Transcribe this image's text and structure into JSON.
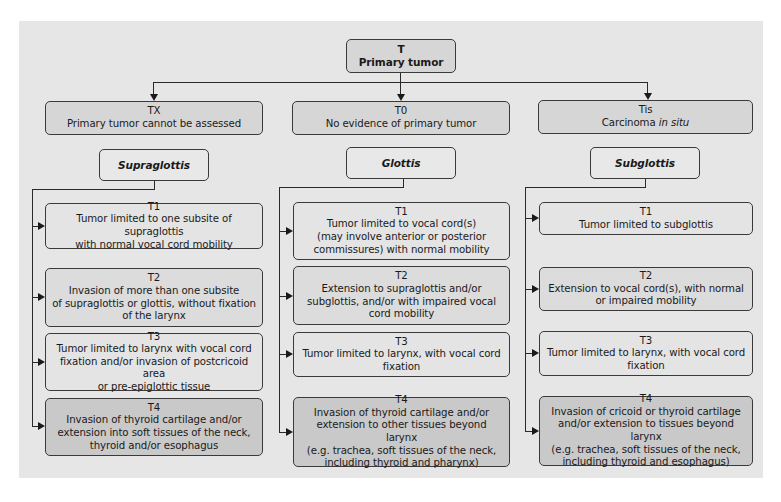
{
  "root": {
    "code": "T",
    "label": "Primary tumor"
  },
  "top_categories": [
    {
      "code": "TX",
      "label": "Primary tumor cannot be assessed"
    },
    {
      "code": "T0",
      "label": "No evidence of primary tumor"
    },
    {
      "code": "Tis",
      "label_plain": "Carcinoma ",
      "label_italic": "in situ"
    }
  ],
  "columns": [
    {
      "region": "Supraglottis",
      "stages": [
        {
          "code": "T1",
          "lines": [
            "Tumor limited to one subsite of supraglottis",
            "with normal vocal cord mobility"
          ]
        },
        {
          "code": "T2",
          "lines": [
            "Invasion of more than one subsite",
            "of supraglottis or glottis, without fixation",
            "of the larynx"
          ]
        },
        {
          "code": "T3",
          "lines": [
            "Tumor limited to larynx with vocal cord",
            "fixation and/or invasion of postcricoid area",
            "or pre-epiglottic tissue"
          ]
        },
        {
          "code": "T4",
          "lines": [
            "Invasion of thyroid cartilage and/or",
            "extension into soft tissues of the neck,",
            "thyroid and/or esophagus"
          ]
        }
      ]
    },
    {
      "region": "Glottis",
      "stages": [
        {
          "code": "T1",
          "lines": [
            "Tumor limited to vocal cord(s)",
            "(may involve anterior or posterior",
            "commissures) with normal mobility"
          ]
        },
        {
          "code": "T2",
          "lines": [
            "Extension to supraglottis and/or",
            "subglottis, and/or with impaired vocal",
            "cord mobility"
          ]
        },
        {
          "code": "T3",
          "lines": [
            "Tumor limited to larynx, with vocal cord",
            "fixation"
          ]
        },
        {
          "code": "T4",
          "lines": [
            "Invasion of thyroid cartilage and/or",
            "extension to other tissues beyond larynx",
            "(e.g. trachea, soft tissues of the neck,",
            "including thyroid and pharynx)"
          ]
        }
      ]
    },
    {
      "region": "Subglottis",
      "stages": [
        {
          "code": "T1",
          "lines": [
            "Tumor limited to subglottis"
          ]
        },
        {
          "code": "T2",
          "lines": [
            "Extension to vocal cord(s), with normal",
            "or impaired mobility"
          ]
        },
        {
          "code": "T3",
          "lines": [
            "Tumor limited to larynx, with vocal cord",
            "fixation"
          ]
        },
        {
          "code": "T4",
          "lines": [
            "Invasion of cricoid or thyroid cartilage",
            "and/or extension to tissues beyond larynx",
            "(e.g. trachea, soft tissues of the neck,",
            "including thyroid and esophagus)"
          ]
        }
      ]
    }
  ],
  "colors": {
    "panel_bg": "#e6e6e6",
    "box_medium": "#d6d6d6",
    "box_light": "#e4e4e4",
    "box_t4": "#c9c9c9",
    "line": "#2a2a2a"
  }
}
